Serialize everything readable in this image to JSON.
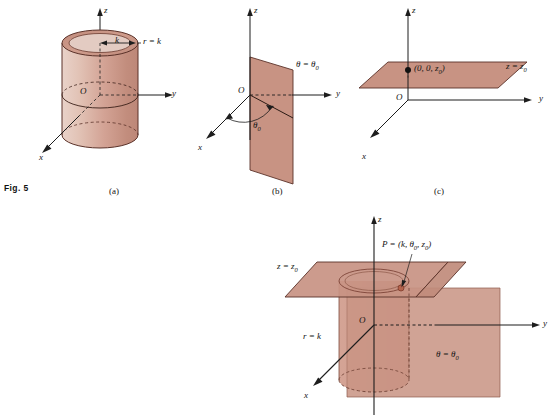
{
  "figure": {
    "number_label": "Fig. 5",
    "background_color": "#ffffff",
    "surface_fill": "#c89383",
    "surface_fill_light": "#e8cdc4",
    "surface_fill_dark": "#b5796a",
    "outline_color": "#5a3128",
    "axis_color": "#1d1d1d",
    "text_color": "#141414",
    "point_color": "#111111"
  },
  "panels": [
    {
      "id": "a",
      "caption": "(a)",
      "description": "cylinder r = k about the z-axis",
      "axes": {
        "x": "x",
        "y": "y",
        "z": "z"
      },
      "origin_label": "O",
      "labels": [
        {
          "name": "radius-k",
          "text": "k"
        },
        {
          "name": "surface-equation",
          "text": "r = k"
        }
      ]
    },
    {
      "id": "b",
      "caption": "(b)",
      "description": "half-plane theta = theta-zero containing the z-axis",
      "axes": {
        "x": "x",
        "y": "y",
        "z": "z"
      },
      "origin_label": "O",
      "labels": [
        {
          "name": "surface-equation",
          "text": "θ = θ0"
        },
        {
          "name": "angle-theta-zero",
          "text": "θ0"
        }
      ]
    },
    {
      "id": "c",
      "caption": "(c)",
      "description": "horizontal plane z = z-zero",
      "axes": {
        "x": "x",
        "y": "y",
        "z": "z"
      },
      "origin_label": "O",
      "labels": [
        {
          "name": "point-coordinates",
          "text": "(0, 0, z0)"
        },
        {
          "name": "surface-equation",
          "text": "z = z0"
        }
      ]
    },
    {
      "id": "d",
      "caption": "",
      "description": "intersection of cylinder, half-plane and horizontal plane meeting at point P",
      "axes": {
        "x": "x",
        "y": "y",
        "z": "z"
      },
      "origin_label": "O",
      "labels": [
        {
          "name": "point-p",
          "text": "P = (k, θ0, z0)"
        },
        {
          "name": "plane-z-equation",
          "text": "z = z0"
        },
        {
          "name": "cylinder-equation",
          "text": "r = k"
        },
        {
          "name": "halfplane-equation",
          "text": "θ = θ0"
        }
      ]
    }
  ],
  "axis_labels": {
    "x": "x",
    "y": "y",
    "z": "z",
    "origin": "O"
  },
  "texts": {
    "fig_number": "Fig. 5",
    "caption_a": "(a)",
    "caption_b": "(b)",
    "caption_c": "(c)",
    "a_radius": "k",
    "a_equation_r": "r",
    "a_equation_eq": " = ",
    "a_equation_k": "k",
    "b_theta_sub": "0",
    "c_point_prefix": "(0, 0, ",
    "c_point_suffix": ")"
  }
}
